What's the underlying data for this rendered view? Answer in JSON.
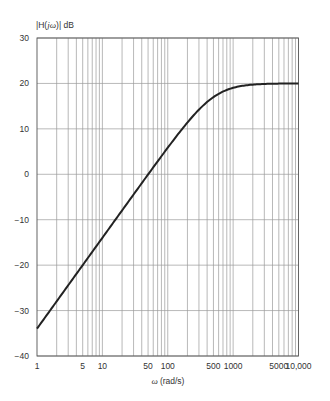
{
  "chart_data": {
    "type": "line",
    "title": "",
    "xlabel": "ω (rad/s)",
    "ylabel": "|H(jω)| dB",
    "xscale": "log",
    "xlim": [
      1,
      10000
    ],
    "ylim": [
      -40,
      30
    ],
    "grid": true,
    "legend": null,
    "x_ticks": [
      "1",
      "5",
      "10",
      "50",
      "100",
      "500",
      "1000",
      "5000",
      "10,000"
    ],
    "x_tick_values": [
      1,
      5,
      10,
      50,
      100,
      500,
      1000,
      5000,
      10000
    ],
    "y_ticks": [
      "30",
      "20",
      "10",
      "0",
      "−10",
      "−20",
      "−30",
      "−40"
    ],
    "y_tick_values": [
      30,
      20,
      10,
      0,
      -10,
      -20,
      -30,
      -40
    ],
    "series": [
      {
        "name": "|H(jω)|",
        "x": [
          1,
          2,
          5,
          10,
          20,
          50,
          100,
          200,
          500,
          1000,
          2000,
          5000,
          10000
        ],
        "values": [
          -34.0,
          -28.0,
          -20.0,
          -14.0,
          -8.0,
          -0.04,
          5.8,
          11.3,
          17.0,
          19.0,
          19.7,
          19.96,
          20.0
        ]
      }
    ]
  },
  "labels": {
    "ylabel_main": "|H(",
    "ylabel_var": "jω",
    "ylabel_end": ")| dB",
    "xlabel_var": "ω",
    "xlabel_unit": "(rad/s)"
  }
}
